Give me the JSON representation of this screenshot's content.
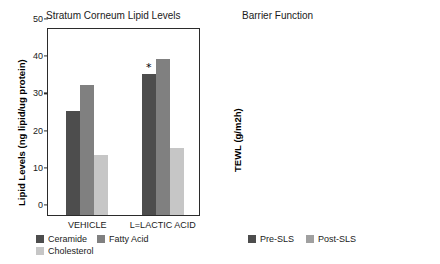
{
  "figure": {
    "panels": [
      "Stratum Corneum Lipid Levels",
      "Barrier Function"
    ]
  },
  "chart_data": [
    {
      "type": "bar",
      "panel_id": "stratum-corneum-lipid-levels",
      "title": "Stratum Corneum Lipid Levels",
      "xlabel": "",
      "ylabel": "Lipid Levels (ng lipid/ug protein)",
      "categories": [
        "VEHICLE",
        "L=LACTIC ACID"
      ],
      "ylim": [
        0,
        50
      ],
      "yticks": [
        0,
        10,
        20,
        30,
        40,
        50
      ],
      "grid": false,
      "legend_position": "bottom-left",
      "series": [
        {
          "name": "Ceramide",
          "color": "#4d4d4d",
          "values": [
            28,
            38
          ]
        },
        {
          "name": "Fatty Acid",
          "color": "#808080",
          "values": [
            35,
            42
          ]
        },
        {
          "name": "Cholesterol",
          "color": "#c6c6c6",
          "values": [
            16,
            18
          ]
        }
      ],
      "annotations": [
        {
          "text": "*",
          "series": "Ceramide",
          "category": "L=LACTIC ACID",
          "value": 38
        }
      ]
    },
    {
      "type": "bar",
      "panel_id": "barrier-function",
      "title": "Barrier Function",
      "xlabel": "",
      "ylabel": "TEWL (g/m2h)",
      "categories": [
        "VEHICLE",
        "L=LACTIC ACID"
      ],
      "ylim": [
        0,
        24
      ],
      "yticks": [
        0,
        6,
        12,
        18,
        24
      ],
      "grid": false,
      "legend_position": "bottom-left",
      "series": [
        {
          "name": "Pre-SLS",
          "color": "#4d4d4d",
          "values": [
            5.3,
            4.1
          ]
        },
        {
          "name": "Post-SLS",
          "color": "#a0a0a0",
          "values": [
            19.0,
            11.3
          ]
        }
      ],
      "annotations": [
        {
          "text": "*",
          "series": "Post-SLS",
          "category": "L=LACTIC ACID",
          "value": 11.3
        }
      ]
    }
  ]
}
